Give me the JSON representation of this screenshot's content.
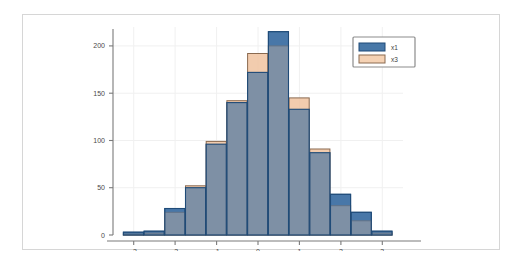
{
  "figure": {
    "background_color": "#ffffff",
    "frame_border_color": "#d6d6d6",
    "axis_color": "#7a7a7a",
    "grid_color": "#f0f0f0",
    "tick_label_color": "#4a4a4a"
  },
  "chart_data": {
    "type": "bar",
    "title": "",
    "subtitle": "",
    "xlabel": "",
    "ylabel": "",
    "xlim": [
      -3.5,
      3.5
    ],
    "ylim": [
      0,
      220
    ],
    "grid": true,
    "legend_position": "top-right",
    "bin_width": 0.5,
    "bin_starts": [
      -3.25,
      -2.75,
      -2.25,
      -1.75,
      -1.25,
      -0.75,
      -0.25,
      0.25,
      0.75,
      1.25,
      1.75,
      2.25,
      2.75
    ],
    "bin_centers": [
      -3.0,
      -2.5,
      -2.0,
      -1.5,
      -1.0,
      -0.5,
      0.0,
      0.5,
      1.0,
      1.5,
      2.0,
      2.5,
      3.0
    ],
    "x_ticks": [
      -3,
      -2,
      -1,
      0,
      1,
      2,
      3
    ],
    "x_tick_labels": [
      "-3",
      "-2",
      "-1",
      "0",
      "1",
      "2",
      "3"
    ],
    "y_ticks": [
      0,
      50,
      100,
      150,
      200
    ],
    "y_tick_labels": [
      "0",
      "50",
      "100",
      "150",
      "200"
    ],
    "series": [
      {
        "name": "x1",
        "color": "#4878a8",
        "edge_color": "#1f4b78",
        "values": [
          3,
          4,
          28,
          50,
          96,
          140,
          172,
          215,
          133,
          87,
          43,
          24,
          4
        ]
      },
      {
        "name": "x3",
        "color": "#f0c3a0",
        "edge_color": "#8a6a50",
        "values": [
          1,
          2,
          24,
          52,
          99,
          142,
          192,
          200,
          145,
          91,
          31,
          15,
          2
        ]
      }
    ]
  },
  "legend": {
    "entries": [
      {
        "label": "x1",
        "swatch_color": "#4878a8",
        "swatch_edge": "#1f4b78"
      },
      {
        "label": "x3",
        "swatch_color": "#f5d2b4",
        "swatch_edge": "#8a6a50"
      }
    ],
    "border_color": "#8c8c8c",
    "background_color": "#ffffff"
  }
}
